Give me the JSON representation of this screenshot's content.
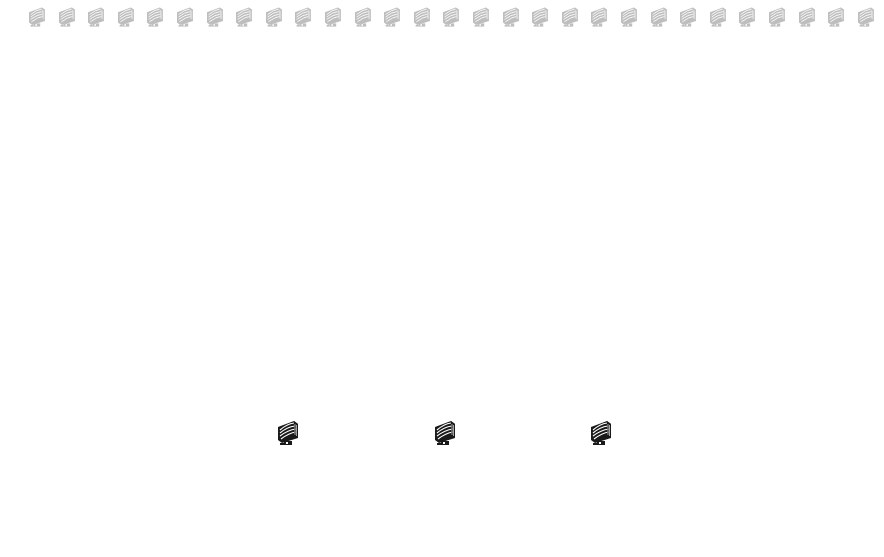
{
  "desktop": {
    "background": "#ffffff",
    "top_row": {
      "icon": "monitor-icon",
      "count": 29,
      "start_x": 26,
      "spacing": 29.6,
      "style": "faded-gray"
    },
    "bottom_icons": [
      {
        "icon": "monitor-icon",
        "x": 275,
        "y": 418
      },
      {
        "icon": "monitor-icon",
        "x": 432,
        "y": 418
      },
      {
        "icon": "monitor-icon",
        "x": 588,
        "y": 418
      }
    ],
    "colors": {
      "top_icon": "#8a8a8a",
      "bottom_icon": "#1a1a1a"
    }
  }
}
